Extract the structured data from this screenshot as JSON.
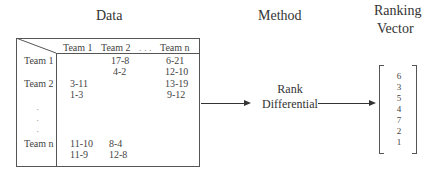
{
  "titles": {
    "data": "Data",
    "method": "Method",
    "ranking_line1": "Ranking",
    "ranking_line2": "Vector"
  },
  "table": {
    "columns": [
      "Team 1",
      "Team 2",
      ". . .",
      "Team n"
    ],
    "rows": [
      {
        "label": "Team 1",
        "cells": [
          [
            "",
            ""
          ],
          [
            "17-8",
            "4-2"
          ],
          [
            "6-21",
            "12-10"
          ]
        ]
      },
      {
        "label": "Team 2",
        "cells": [
          [
            "3-11",
            "1-3"
          ],
          [
            "",
            ""
          ],
          [
            "13-19",
            "9-12"
          ]
        ]
      },
      {
        "label": "Team n",
        "cells": [
          [
            "11-10",
            "11-9"
          ],
          [
            "8-4",
            "12-8"
          ],
          [
            "",
            ""
          ]
        ]
      }
    ],
    "ellipsis_rows": [
      "·",
      "·",
      "·"
    ]
  },
  "method": {
    "line1": "Rank",
    "line2": "Differential"
  },
  "ranking_vector": [
    "6",
    "3",
    "5",
    "4",
    "7",
    "2",
    "1"
  ]
}
